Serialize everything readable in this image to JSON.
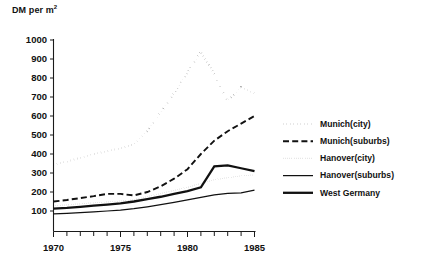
{
  "chart_data": {
    "type": "line",
    "ylabel": "DM per m²",
    "xlabel": "",
    "xlim": [
      1970,
      1985
    ],
    "ylim": [
      0,
      1000
    ],
    "grid": false,
    "legend_position": "right",
    "y_ticks": [
      100,
      200,
      300,
      400,
      500,
      600,
      700,
      800,
      900,
      1000
    ],
    "y_tick_labels": [
      "100",
      "200",
      "300",
      "400",
      "500",
      "600",
      "700",
      "800",
      "900",
      "1000"
    ],
    "x_ticks": [
      1970,
      1971,
      1972,
      1973,
      1974,
      1975,
      1976,
      1977,
      1978,
      1979,
      1980,
      1981,
      1982,
      1983,
      1984,
      1985
    ],
    "x_tick_labels": [
      "1970",
      "1975",
      "1980",
      "1985"
    ],
    "x_labeled_ticks": [
      1970,
      1975,
      1980,
      1985
    ],
    "x": [
      1970,
      1971,
      1972,
      1973,
      1974,
      1975,
      1976,
      1977,
      1978,
      1979,
      1980,
      1981,
      1982,
      1983,
      1984,
      1985
    ],
    "series": [
      {
        "name": "Munich (city)",
        "style": "dotted-thick",
        "values": [
          345,
          360,
          380,
          400,
          415,
          430,
          450,
          520,
          620,
          720,
          830,
          940,
          820,
          680,
          750,
          720
        ]
      },
      {
        "name": "Munich (suburbs)",
        "style": "dashed",
        "values": [
          150,
          158,
          168,
          178,
          190,
          190,
          182,
          200,
          230,
          270,
          320,
          400,
          470,
          520,
          560,
          600
        ]
      },
      {
        "name": "Hanover (city)",
        "style": "dotted-fine",
        "values": [
          128,
          132,
          138,
          143,
          148,
          152,
          160,
          175,
          192,
          208,
          225,
          245,
          265,
          275,
          285,
          290
        ]
      },
      {
        "name": "Hanover (suburbs)",
        "style": "solid-thin",
        "values": [
          85,
          88,
          92,
          96,
          100,
          105,
          112,
          122,
          133,
          145,
          158,
          172,
          185,
          193,
          196,
          210
        ]
      },
      {
        "name": "West Germany",
        "style": "solid-thick",
        "values": [
          112,
          116,
          122,
          128,
          134,
          140,
          150,
          162,
          175,
          190,
          205,
          225,
          335,
          340,
          325,
          310
        ]
      }
    ],
    "legend": [
      {
        "label": "Munich(city)",
        "style": "dotted-thick"
      },
      {
        "label": "Munich(suburbs)",
        "style": "dashed"
      },
      {
        "label": "Hanover(city)",
        "style": "dotted-fine"
      },
      {
        "label": "Hanover(suburbs)",
        "style": "solid-thin"
      },
      {
        "label": "West Germany",
        "style": "solid-thick"
      }
    ],
    "colors": {
      "ink": "#111111",
      "background": "#ffffff"
    }
  }
}
